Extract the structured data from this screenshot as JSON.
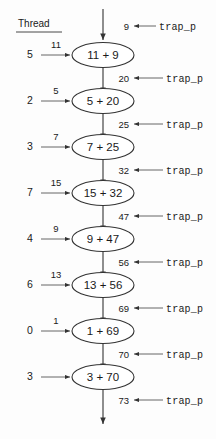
{
  "header": {
    "thread_label": "Thread"
  },
  "trap_label": "trap_p",
  "rows": [
    {
      "thread": "5",
      "in_value": "11",
      "node": "11 + 9",
      "out_value": "20",
      "trap": "trap_p"
    },
    {
      "thread": "2",
      "in_value": "5",
      "node": "5 + 20",
      "out_value": "25",
      "trap": "trap_p"
    },
    {
      "thread": "3",
      "in_value": "7",
      "node": "7 + 25",
      "out_value": "32",
      "trap": "trap_p"
    },
    {
      "thread": "7",
      "in_value": "15",
      "node": "15 + 32",
      "out_value": "47",
      "trap": "trap_p"
    },
    {
      "thread": "4",
      "in_value": "9",
      "node": "9 + 47",
      "out_value": "56",
      "trap": "trap_p"
    },
    {
      "thread": "6",
      "in_value": "13",
      "node": "13 + 56",
      "out_value": "69",
      "trap": "trap_p"
    },
    {
      "thread": "0",
      "in_value": "1",
      "node": "1 + 69",
      "out_value": "70",
      "trap": "trap_p"
    },
    {
      "thread": "3",
      "in_value": "",
      "node": "3 + 70",
      "out_value": "73",
      "trap": "trap_p"
    }
  ],
  "top_inflow": {
    "value": "9",
    "trap": "trap_p"
  }
}
